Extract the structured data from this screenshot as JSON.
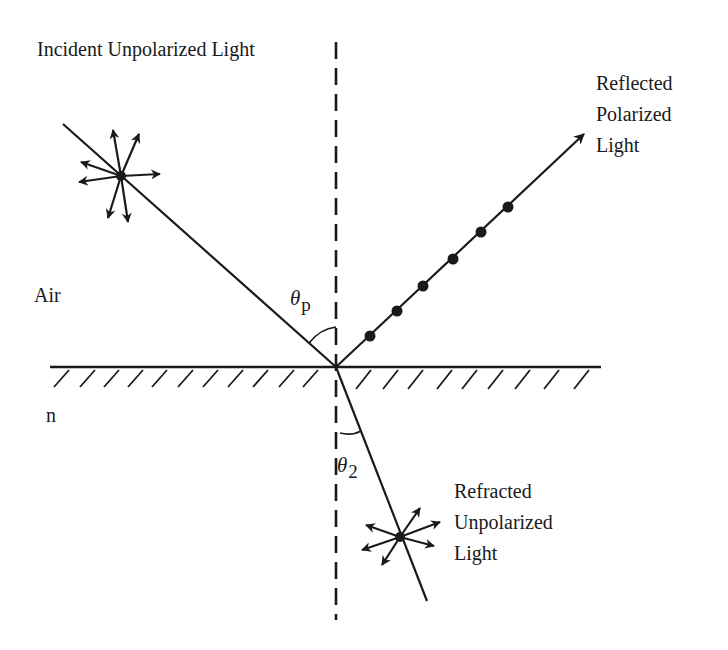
{
  "diagram": {
    "colors": {
      "ink": "#1a1a1a",
      "background": "#ffffff"
    },
    "labels": {
      "incident": "Incident Unpolarized Light",
      "reflected": "Reflected\nPolarized\nLight",
      "refracted": "Refracted\nUnpolarized\nLight",
      "medium_top": "Air",
      "medium_bottom": "n",
      "angle_incident_symbol": "θ",
      "angle_incident_sub": "p",
      "angle_refracted_symbol": "θ",
      "angle_refracted_sub": "2"
    },
    "nodes": [
      {
        "id": "incident_ray",
        "label": "Incident Unpolarized Light",
        "type": "ray",
        "polarization_glyph": "star-arrows"
      },
      {
        "id": "reflected_ray",
        "label": "Reflected Polarized Light",
        "type": "ray",
        "polarization_glyph": "dots",
        "dot_count": 6
      },
      {
        "id": "refracted_ray",
        "label": "Refracted Unpolarized Light",
        "type": "ray",
        "polarization_glyph": "star-arrows"
      },
      {
        "id": "interface",
        "label": "Air / n boundary",
        "type": "surface",
        "hatched": true
      },
      {
        "id": "normal",
        "label": "Normal",
        "type": "dashed-line"
      }
    ],
    "angles": [
      {
        "id": "theta_p",
        "label": "θp",
        "between": [
          "incident_ray",
          "normal"
        ]
      },
      {
        "id": "theta_2",
        "label": "θ2",
        "between": [
          "refracted_ray",
          "normal"
        ]
      }
    ]
  }
}
